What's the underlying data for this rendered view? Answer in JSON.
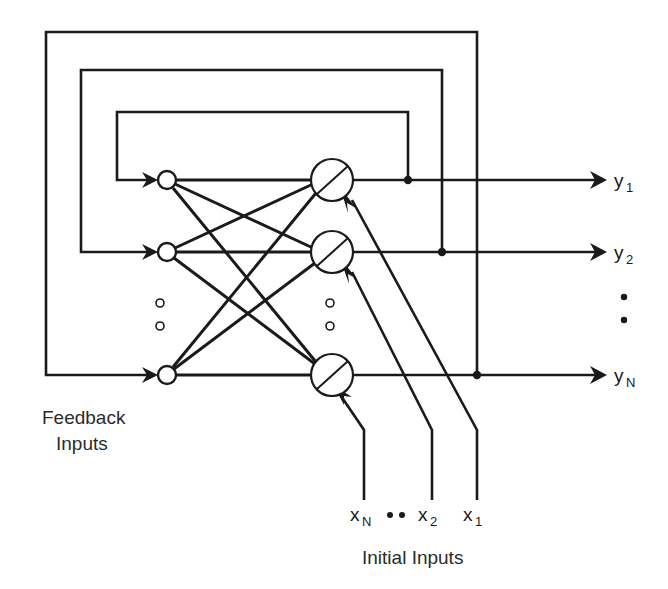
{
  "figure": {
    "type": "block-diagram",
    "background_color": "#ffffff",
    "line_color": "#1a1a1a",
    "text_color": "#2b2b2b"
  },
  "labels": {
    "feedback_inputs_line1": "Feedback",
    "feedback_inputs_line2": "Inputs",
    "initial_inputs": "Initial Inputs"
  },
  "outputs": [
    {
      "base": "y",
      "sub": "1",
      "y": 180,
      "arrow_x": 600,
      "label_x": 614,
      "junction_x": 408
    },
    {
      "base": "y",
      "sub": "2",
      "y": 252,
      "arrow_x": 600,
      "label_x": 614,
      "junction_x": 442
    },
    {
      "base": "y",
      "sub": "N",
      "y": 375,
      "arrow_x": 600,
      "label_x": 614,
      "junction_x": 477
    }
  ],
  "output_ellipsis": {
    "x": 622,
    "dots_y": [
      297,
      320
    ],
    "radius": 3.2
  },
  "inputs": [
    {
      "base": "x",
      "sub": "N",
      "label_x": 355,
      "label_y": 521,
      "stem_x": 364,
      "stem_bottom": 500,
      "bend_y": 430,
      "target_x": 337,
      "target_y": 392
    },
    {
      "base": "x",
      "sub": "2",
      "label_x": 423,
      "label_y": 521,
      "stem_x": 432,
      "stem_bottom": 500,
      "bend_y": 430,
      "target_x": 350,
      "target_y": 270
    },
    {
      "base": "x",
      "sub": "1",
      "label_x": 468,
      "label_y": 521,
      "stem_x": 477,
      "stem_bottom": 500,
      "bend_y": 430,
      "target_x": 350,
      "target_y": 198
    }
  ],
  "input_ellipsis": {
    "dots": [
      {
        "x": 390,
        "y": 515
      },
      {
        "x": 402,
        "y": 515
      }
    ],
    "radius": 3.0
  },
  "feedback_nodes": [
    {
      "cx": 167,
      "cy": 180,
      "r": 9
    },
    {
      "cx": 167,
      "cy": 252,
      "r": 9
    },
    {
      "cx": 167,
      "cy": 375,
      "r": 9
    }
  ],
  "node_ellipsis": {
    "x": 160,
    "dots_y": [
      303,
      326
    ],
    "radius": 4.0
  },
  "neurons": [
    {
      "cx": 332,
      "cy": 180,
      "r": 21
    },
    {
      "cx": 332,
      "cy": 252,
      "r": 21
    },
    {
      "cx": 332,
      "cy": 375,
      "r": 21
    }
  ],
  "neuron_ellipsis": {
    "x": 330,
    "dots_y": [
      303,
      326
    ],
    "radius": 4.0
  },
  "feedback_paths": [
    {
      "name": "inner-loop-y1",
      "left_x": 117,
      "top_y": 112,
      "right_x": 408,
      "bottom_y": 180
    },
    {
      "name": "middle-loop-y2",
      "left_x": 81,
      "top_y": 70,
      "right_x": 442,
      "bottom_y": 252
    },
    {
      "name": "outer-loop-yN",
      "left_x": 46,
      "top_y": 32,
      "right_x": 477,
      "bottom_y": 375
    }
  ],
  "synapse_count": 9,
  "text_positions": {
    "feedback_label_x": 42,
    "feedback_label_y1": 424,
    "feedback_label_y2": 450,
    "initial_label_x": 362,
    "initial_label_y": 564
  }
}
